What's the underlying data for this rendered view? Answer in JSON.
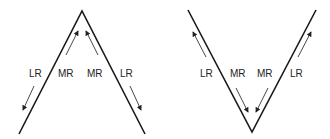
{
  "diagrams": [
    {
      "shape": "inverted-V (peak)",
      "labels": {
        "left_outer": "LR",
        "left_inner": "MR",
        "right_inner": "MR",
        "right_outer": "LR"
      },
      "arrows": {
        "left_outer": "down-away",
        "left_inner": "up-toward-peak",
        "right_inner": "up-toward-peak",
        "right_outer": "down-away"
      }
    },
    {
      "shape": "V (trough)",
      "labels": {
        "left_outer": "LR",
        "left_inner": "MR",
        "right_inner": "MR",
        "right_outer": "LR"
      },
      "arrows": {
        "left_outer": "up-away",
        "left_inner": "down-toward-trough",
        "right_inner": "down-toward-trough",
        "right_outer": "up-away"
      }
    }
  ],
  "colors": {
    "line": "#1a1a1a",
    "arrow": "#333333"
  }
}
